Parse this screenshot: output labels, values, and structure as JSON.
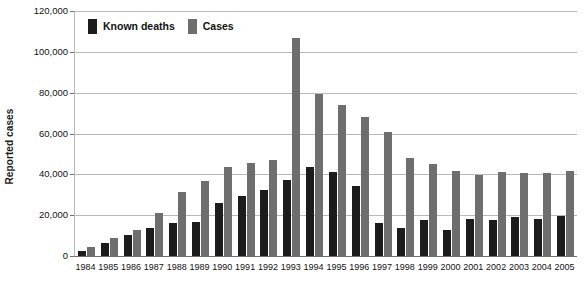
{
  "chart_data": {
    "type": "bar",
    "title": "",
    "xlabel": "",
    "ylabel": "Reported cases",
    "ylim": [
      0,
      120000
    ],
    "ytick_step": 20000,
    "grid": true,
    "legend_position": "top-left-inside",
    "categories": [
      "1984",
      "1985",
      "1986",
      "1987",
      "1988",
      "1989",
      "1990",
      "1991",
      "1992",
      "1993",
      "1994",
      "1995",
      "1996",
      "1997",
      "1998",
      "1999",
      "2000",
      "2001",
      "2002",
      "2003",
      "2004",
      "2005"
    ],
    "series": [
      {
        "name": "Known deaths",
        "color": "#1c1c1c",
        "values": [
          2500,
          6500,
          10500,
          13500,
          16000,
          16500,
          26000,
          29500,
          32500,
          37000,
          43500,
          41000,
          34500,
          16000,
          13500,
          17500,
          12500,
          18000,
          17500,
          19000,
          18000,
          19500
        ]
      },
      {
        "name": "Cases",
        "color": "#6e6e6e",
        "values": [
          4500,
          9000,
          12500,
          21000,
          31500,
          36500,
          43500,
          45500,
          47000,
          107000,
          79500,
          74000,
          68000,
          60500,
          48000,
          45000,
          41500,
          39500,
          41000,
          40500,
          40500,
          41500
        ]
      }
    ],
    "ytick_labels": [
      "0",
      "20,000",
      "40,000",
      "60,000",
      "80,000",
      "100,000",
      "120,000"
    ],
    "ytick_values": [
      0,
      20000,
      40000,
      60000,
      80000,
      100000,
      120000
    ]
  },
  "legend": {
    "items": [
      {
        "label": "Known deaths",
        "color": "#1c1c1c",
        "swatch": "legend-swatch-known-deaths"
      },
      {
        "label": "Cases",
        "color": "#6e6e6e",
        "swatch": "legend-swatch-cases"
      }
    ]
  },
  "axis": {
    "y_title": "Reported cases"
  },
  "colors": {
    "deaths": "#1c1c1c",
    "cases": "#6e6e6e",
    "grid": "#b9b9b9",
    "axis": "#6f6f6f",
    "text": "#111111",
    "background": "#ffffff"
  }
}
